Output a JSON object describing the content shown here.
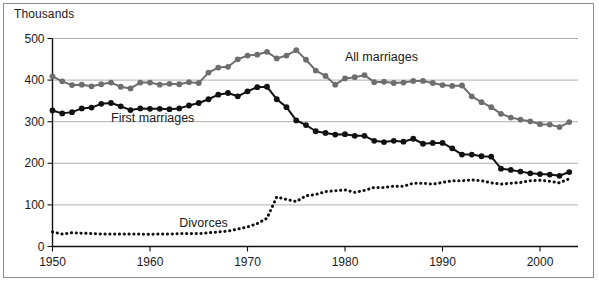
{
  "figure": {
    "unit_label": "Thousands",
    "background": "#ffffff",
    "frame_color": "#8c8c8c"
  },
  "chart_data": {
    "type": "line",
    "title": "",
    "subtitle": "",
    "xlabel": "",
    "ylabel": "Thousands",
    "xlim": [
      1950,
      2003
    ],
    "ylim": [
      0,
      500
    ],
    "yticks": [
      0,
      100,
      200,
      300,
      400,
      500
    ],
    "xticks": [
      1950,
      1960,
      1970,
      1980,
      1990,
      2000
    ],
    "grid": "horizontal",
    "legend_position": "inline-annotations",
    "x": [
      1950,
      1951,
      1952,
      1953,
      1954,
      1955,
      1956,
      1957,
      1958,
      1959,
      1960,
      1961,
      1962,
      1963,
      1964,
      1965,
      1966,
      1967,
      1968,
      1969,
      1970,
      1971,
      1972,
      1973,
      1974,
      1975,
      1976,
      1977,
      1978,
      1979,
      1980,
      1981,
      1982,
      1983,
      1984,
      1985,
      1986,
      1987,
      1988,
      1989,
      1990,
      1991,
      1992,
      1993,
      1994,
      1995,
      1996,
      1997,
      1998,
      1999,
      2000,
      2001,
      2002,
      2003
    ],
    "series": [
      {
        "name": "All marriages",
        "color": "#6e6e6e",
        "style": "solid-markers",
        "label_x": 1980,
        "label_y": 452,
        "values": [
          409,
          397,
          388,
          389,
          385,
          390,
          394,
          384,
          380,
          394,
          394,
          389,
          391,
          390,
          395,
          393,
          418,
          430,
          432,
          450,
          459,
          461,
          468,
          452,
          459,
          472,
          449,
          423,
          410,
          389,
          404,
          407,
          412,
          395,
          396,
          393,
          394,
          398,
          398,
          393,
          388,
          386,
          387,
          361,
          347,
          335,
          319,
          310,
          305,
          301,
          294,
          293,
          287,
          299
        ]
      },
      {
        "name": "First marriages",
        "color": "#111111",
        "style": "solid-markers",
        "label_x": 1956,
        "label_y": 306,
        "values": [
          327,
          320,
          323,
          332,
          334,
          343,
          345,
          337,
          328,
          332,
          331,
          331,
          330,
          332,
          339,
          345,
          354,
          365,
          369,
          361,
          373,
          383,
          384,
          354,
          335,
          303,
          292,
          277,
          273,
          269,
          270,
          266,
          266,
          254,
          251,
          254,
          252,
          259,
          247,
          249,
          249,
          236,
          221,
          221,
          217,
          216,
          187,
          184,
          180,
          176,
          174,
          173,
          170,
          179
        ]
      },
      {
        "name": "Divorces",
        "color": "#111111",
        "style": "dotted",
        "label_x": 1963,
        "label_y": 54,
        "values": [
          35,
          30,
          33,
          32,
          31,
          30,
          30,
          30,
          30,
          30,
          29,
          30,
          30,
          31,
          31,
          31,
          33,
          35,
          37,
          42,
          47,
          55,
          68,
          119,
          113,
          108,
          122,
          125,
          132,
          134,
          136,
          130,
          135,
          142,
          142,
          145,
          145,
          152,
          152,
          150,
          154,
          158,
          158,
          160,
          158,
          153,
          150,
          152,
          154,
          158,
          159,
          157,
          153,
          163
        ]
      }
    ],
    "annotations": [
      {
        "text": "All marriages",
        "x": 1980,
        "y": 452
      },
      {
        "text": "First marriages",
        "x": 1956,
        "y": 306
      },
      {
        "text": "Divorces",
        "x": 1963,
        "y": 54
      }
    ]
  }
}
